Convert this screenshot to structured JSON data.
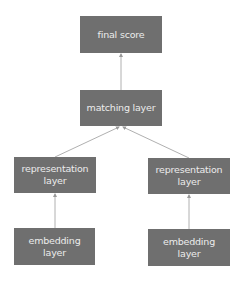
{
  "diagram": {
    "nodes": {
      "final_score": "final score",
      "matching_layer": "matching layer",
      "representation_left": "representation layer",
      "representation_right": "representation layer",
      "embedding_left": "embedding layer",
      "embedding_right": "embedding layer"
    },
    "edges": [
      {
        "from": "matching_layer",
        "to": "final_score"
      },
      {
        "from": "representation_left",
        "to": "matching_layer"
      },
      {
        "from": "representation_right",
        "to": "matching_layer"
      },
      {
        "from": "embedding_left",
        "to": "representation_left"
      },
      {
        "from": "embedding_right",
        "to": "representation_right"
      }
    ],
    "colors": {
      "box": "#6f6f6f",
      "text": "#ececec",
      "edge": "#b0b0b0"
    }
  }
}
